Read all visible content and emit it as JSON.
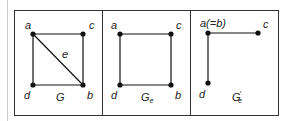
{
  "figure": {
    "panels": [
      {
        "id": "G",
        "title": "G",
        "title_sub": "",
        "title_prime": "",
        "vertices": [
          {
            "name": "a",
            "label": "a"
          },
          {
            "name": "c",
            "label": "c"
          },
          {
            "name": "d",
            "label": "d"
          },
          {
            "name": "b",
            "label": "b"
          }
        ],
        "edges": [
          [
            "a",
            "c"
          ],
          [
            "c",
            "b"
          ],
          [
            "b",
            "d"
          ],
          [
            "d",
            "a"
          ],
          [
            "a",
            "b"
          ]
        ],
        "edge_labels": [
          {
            "edge": [
              "a",
              "b"
            ],
            "label": "e"
          }
        ]
      },
      {
        "id": "G_e",
        "title": "G",
        "title_sub": "e",
        "title_prime": "",
        "vertices": [
          {
            "name": "a",
            "label": "a"
          },
          {
            "name": "c",
            "label": "c"
          },
          {
            "name": "d",
            "label": "d"
          },
          {
            "name": "b",
            "label": "b"
          }
        ],
        "edges": [
          [
            "a",
            "c"
          ],
          [
            "c",
            "b"
          ],
          [
            "b",
            "d"
          ],
          [
            "d",
            "a"
          ]
        ]
      },
      {
        "id": "G_e_prime",
        "title": "G",
        "title_sub": "e",
        "title_prime": "′",
        "vertices": [
          {
            "name": "a",
            "label": "a(=b)"
          },
          {
            "name": "c",
            "label": "c"
          },
          {
            "name": "d",
            "label": "d"
          }
        ],
        "edges": [
          [
            "a",
            "c"
          ],
          [
            "a",
            "d"
          ]
        ]
      }
    ],
    "colors": {
      "line": "#111111",
      "border": "#333333",
      "text": "#222222"
    }
  }
}
